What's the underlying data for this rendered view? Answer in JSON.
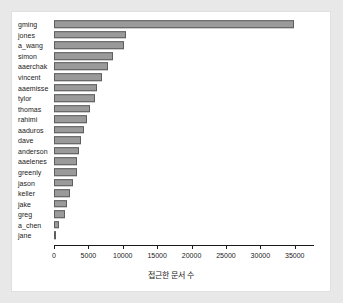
{
  "chart_data": {
    "type": "bar",
    "orientation": "horizontal",
    "title": "",
    "xlabel": "접근한 문서 수",
    "ylabel": "",
    "xlim": [
      0,
      37800
    ],
    "ylim": null,
    "grid": false,
    "legend": null,
    "xticks": [
      0,
      5000,
      10000,
      15000,
      20000,
      25000,
      30000,
      35000
    ],
    "xtick_labels": [
      "0",
      "5000",
      "10000",
      "15000",
      "20000",
      "25000",
      "30000",
      "35000"
    ],
    "categories": [
      "gming",
      "jones",
      "a_wang",
      "simon",
      "aaerchak",
      "vincent",
      "aaemisse",
      "tylor",
      "thomas",
      "rahimi",
      "aaduros",
      "dave",
      "anderson",
      "aaelenes",
      "greenly",
      "jason",
      "keller",
      "jake",
      "greg",
      "a_chen",
      "jane"
    ],
    "values": [
      34900,
      10400,
      10200,
      8600,
      7900,
      7000,
      6200,
      6000,
      5200,
      4800,
      4300,
      3950,
      3700,
      3400,
      3350,
      2800,
      2350,
      1850,
      1600,
      700,
      180
    ],
    "bar_color": "#9a9a9a",
    "bar_edge_color": "#5e5e5e",
    "panel_color": "#ffffff",
    "background_color": "#e8e8e8"
  }
}
